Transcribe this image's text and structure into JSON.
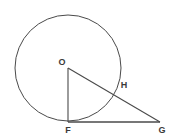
{
  "figure": {
    "kind": "geometry-diagram",
    "background_color": "#ffffff",
    "stroke_color": "#4a4a4a",
    "label_color": "#3a3a3a",
    "stroke_width": 1,
    "canvas": {
      "width": 172,
      "height": 140
    }
  },
  "circle": {
    "name": "circle-O",
    "center_label": "O",
    "cx": 68,
    "cy": 68,
    "r": 53,
    "fill": "none",
    "stroke": "#4a4a4a"
  },
  "points": [
    {
      "id": "O",
      "label": "O",
      "x": 68,
      "y": 68,
      "label_x": 62,
      "label_y": 63,
      "role": "circle-center"
    },
    {
      "id": "F",
      "label": "F",
      "x": 68,
      "y": 122,
      "label_x": 68,
      "label_y": 131,
      "role": "tangent-point"
    },
    {
      "id": "G",
      "label": "G",
      "x": 160,
      "y": 122,
      "label_x": 162,
      "label_y": 131,
      "role": "external-point"
    },
    {
      "id": "H",
      "label": "H",
      "x": 117,
      "y": 90,
      "label_x": 124,
      "label_y": 86,
      "role": "secant-circle-intersection"
    }
  ],
  "segments": [
    {
      "id": "OF",
      "from": "O",
      "to": "F",
      "x1": 68,
      "y1": 68,
      "x2": 68,
      "y2": 122,
      "description": "radius to tangent point"
    },
    {
      "id": "OG",
      "from": "O",
      "to": "G",
      "x1": 68,
      "y1": 68,
      "x2": 160,
      "y2": 122,
      "description": "segment from center through H to G"
    },
    {
      "id": "FG",
      "from": "F",
      "to": "G",
      "x1": 68,
      "y1": 122,
      "x2": 160,
      "y2": 122,
      "description": "tangent segment"
    }
  ]
}
